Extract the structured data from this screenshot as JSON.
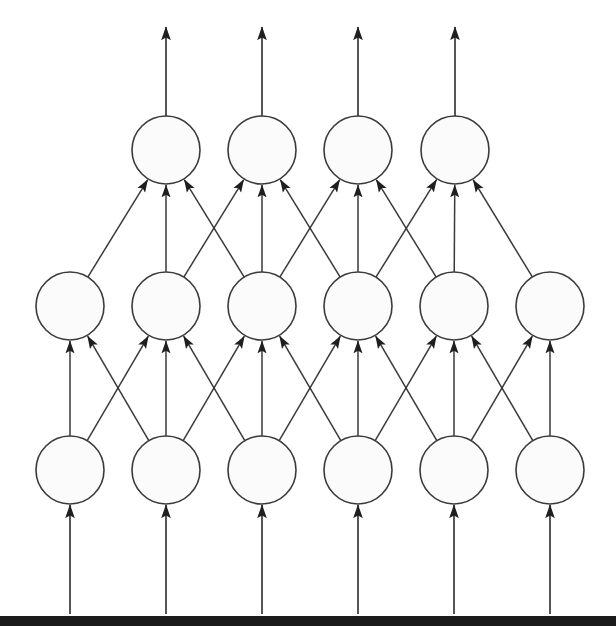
{
  "figure": {
    "type": "diagram",
    "width": 616,
    "height": 626,
    "background_color": "#ffffff",
    "node_fill_color": "#fbfbfb",
    "node_stroke_color": "#3a3a3a",
    "edge_color": "#3a3a3a",
    "footer_bar_color": "#1b1b1b"
  },
  "geometry": {
    "node_radius": 34,
    "layers": [
      {
        "name": "output-layer",
        "index": 2,
        "count": 4,
        "center_y": 150,
        "centers_x": [
          166,
          262,
          358,
          455
        ]
      },
      {
        "name": "hidden-layer",
        "index": 1,
        "count": 6,
        "center_y": 306,
        "centers_x": [
          70,
          166,
          262,
          358,
          454,
          550
        ]
      },
      {
        "name": "input-layer",
        "index": 0,
        "count": 6,
        "center_y": 470,
        "centers_x": [
          70,
          166,
          262,
          358,
          454,
          550
        ]
      }
    ],
    "output_arrow_tip_y": 27,
    "input_arrow_tail_y": 614,
    "footer_bar": {
      "y": 616,
      "height": 10
    }
  },
  "edges": {
    "input_to_hidden": [
      {
        "from": 0,
        "to": 0
      },
      {
        "from": 1,
        "to": 0
      },
      {
        "from": 0,
        "to": 1
      },
      {
        "from": 1,
        "to": 1
      },
      {
        "from": 2,
        "to": 1
      },
      {
        "from": 1,
        "to": 2
      },
      {
        "from": 2,
        "to": 2
      },
      {
        "from": 3,
        "to": 2
      },
      {
        "from": 2,
        "to": 3
      },
      {
        "from": 3,
        "to": 3
      },
      {
        "from": 4,
        "to": 3
      },
      {
        "from": 3,
        "to": 4
      },
      {
        "from": 4,
        "to": 4
      },
      {
        "from": 5,
        "to": 4
      },
      {
        "from": 4,
        "to": 5
      },
      {
        "from": 5,
        "to": 5
      }
    ],
    "hidden_to_output": [
      {
        "from": 0,
        "to": 0
      },
      {
        "from": 1,
        "to": 0
      },
      {
        "from": 2,
        "to": 0
      },
      {
        "from": 1,
        "to": 1
      },
      {
        "from": 2,
        "to": 1
      },
      {
        "from": 3,
        "to": 1
      },
      {
        "from": 2,
        "to": 2
      },
      {
        "from": 3,
        "to": 2
      },
      {
        "from": 4,
        "to": 2
      },
      {
        "from": 3,
        "to": 3
      },
      {
        "from": 4,
        "to": 3
      },
      {
        "from": 5,
        "to": 3
      }
    ]
  },
  "nodes": {
    "output": [
      {
        "label": ""
      },
      {
        "label": ""
      },
      {
        "label": ""
      },
      {
        "label": ""
      }
    ],
    "hidden": [
      {
        "label": ""
      },
      {
        "label": ""
      },
      {
        "label": ""
      },
      {
        "label": ""
      },
      {
        "label": ""
      },
      {
        "label": ""
      }
    ],
    "input": [
      {
        "label": ""
      },
      {
        "label": ""
      },
      {
        "label": ""
      },
      {
        "label": ""
      },
      {
        "label": ""
      },
      {
        "label": ""
      }
    ]
  }
}
